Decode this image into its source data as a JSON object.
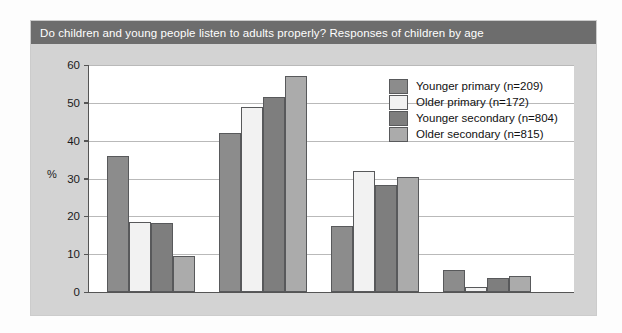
{
  "chart_data": {
    "type": "bar",
    "title": "Do children and young people listen to adults properly? Responses of children by age",
    "xlabel": "",
    "ylabel": "%",
    "ylim": [
      0,
      60
    ],
    "yticks": [
      "0",
      "10",
      "20",
      "30",
      "40",
      "50",
      "60"
    ],
    "grid": true,
    "legend_position": "upper right",
    "categories": [
      "Most of the time",
      "Sometimes",
      "Not very often",
      "Don't know"
    ],
    "series": [
      {
        "name": "Younger primary (n=209)",
        "color": "#8c8c8c",
        "values": [
          36,
          42,
          17.5,
          5.8
        ]
      },
      {
        "name": "Older primary (n=172)",
        "color": "#f2f2f2",
        "values": [
          18.6,
          49,
          32,
          1.3
        ]
      },
      {
        "name": "Younger secondary (n=804)",
        "color": "#7e7e7e",
        "values": [
          18.2,
          51.5,
          28.2,
          3.6
        ]
      },
      {
        "name": "Older secondary (n=815)",
        "color": "#ababab",
        "values": [
          9.6,
          57,
          30.5,
          4.3
        ]
      }
    ]
  },
  "colors": {
    "title_bar": "#6d6d6d",
    "title_text": "#ffffff",
    "panel": "#d3d3d3",
    "plot_background": "#ffffff",
    "gridline": "#b9b9b9",
    "axis": "#555555"
  }
}
